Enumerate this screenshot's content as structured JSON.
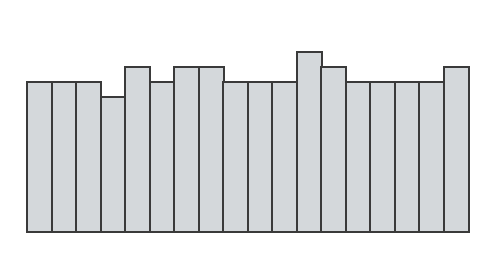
{
  "chart_data": {
    "type": "bar",
    "title": "",
    "xlabel": "",
    "ylabel": "",
    "categories": [
      "1",
      "2",
      "3",
      "4",
      "5",
      "6",
      "7",
      "8",
      "9",
      "10",
      "11",
      "12",
      "13",
      "14",
      "15",
      "16",
      "17",
      "18"
    ],
    "values": [
      10,
      10,
      10,
      9,
      11,
      10,
      11,
      11,
      10,
      10,
      10,
      12,
      11,
      10,
      10,
      10,
      10,
      11
    ],
    "ylim": [
      0,
      12
    ],
    "grid": false,
    "legend": null,
    "bar_fill": "#d4d8db",
    "bar_edge": "#3a3a3a"
  },
  "layout": {
    "plot_height_px": 233,
    "unit_px": 15.2,
    "bar_width_px": 24.5
  }
}
